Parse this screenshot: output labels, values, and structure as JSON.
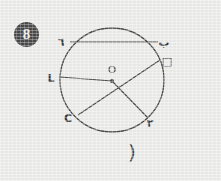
{
  "page": {
    "background_color": "#ededeb",
    "ink_color": "#4a4a4a",
    "question_number": "8"
  },
  "badge": {
    "label": "8"
  },
  "caption": {
    "text": "("
  },
  "diagram": {
    "type": "circle-geometry",
    "center_label": "O",
    "circle": {
      "cx": 112,
      "cy": 80,
      "r": 52
    },
    "points": [
      {
        "id": "A",
        "label": "٦",
        "x": 70,
        "y": 42,
        "label_x": 62,
        "label_y": 44
      },
      {
        "id": "B",
        "label": "ب",
        "x": 158,
        "y": 42,
        "label_x": 160,
        "label_y": 44
      },
      {
        "id": "D",
        "label": "□",
        "x": 160,
        "y": 60,
        "label_x": 163,
        "label_y": 62
      },
      {
        "id": "W",
        "label": "L",
        "x": 60,
        "y": 77,
        "label_x": 50,
        "label_y": 80
      },
      {
        "id": "H",
        "label": "C",
        "x": 78,
        "y": 115,
        "label_x": 66,
        "label_y": 119
      },
      {
        "id": "E",
        "label": "٢",
        "x": 148,
        "y": 118,
        "label_x": 146,
        "label_y": 123
      }
    ],
    "segments": [
      {
        "name": "chord-a-b",
        "from": "A",
        "to": "B"
      },
      {
        "name": "radius-o-w",
        "from": "O",
        "to": "W"
      },
      {
        "name": "chord-h-d",
        "from": "H",
        "to": "D"
      },
      {
        "name": "radius-o-e",
        "from": "O",
        "to": "E"
      }
    ]
  }
}
